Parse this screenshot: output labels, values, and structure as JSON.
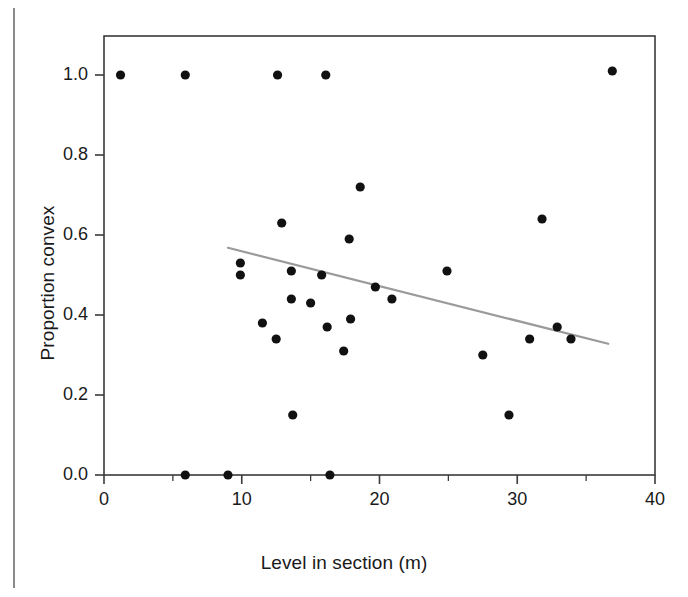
{
  "figure": {
    "background": "#ffffff",
    "frame_color": "#3a3a3a",
    "point_color": "#111111",
    "trend_color": "#9a9a9a"
  },
  "chart_data": {
    "type": "scatter",
    "title": "",
    "xlabel": "Level in section (m)",
    "ylabel": "Proportion convex",
    "xlim": [
      0,
      40
    ],
    "ylim": [
      0.0,
      1.08
    ],
    "grid": false,
    "legend": null,
    "xticks": [
      0,
      10,
      20,
      30,
      40
    ],
    "xtick_labels": [
      "0",
      "10",
      "20",
      "30",
      "40"
    ],
    "xminor_ticks": [
      5,
      15,
      25,
      35
    ],
    "yticks": [
      0.0,
      0.2,
      0.4,
      0.6,
      0.8,
      1.0
    ],
    "ytick_labels": [
      "0.0",
      "0.2",
      "0.4",
      "0.6",
      "0.8",
      "1.0"
    ],
    "series": [
      {
        "name": "Proportion convex by level",
        "marker": "filled-circle",
        "points": [
          {
            "x": 1.2,
            "y": 1.0
          },
          {
            "x": 5.9,
            "y": 1.0
          },
          {
            "x": 12.6,
            "y": 1.0
          },
          {
            "x": 16.1,
            "y": 1.0
          },
          {
            "x": 36.9,
            "y": 1.01
          },
          {
            "x": 18.6,
            "y": 0.72
          },
          {
            "x": 31.8,
            "y": 0.64
          },
          {
            "x": 12.9,
            "y": 0.63
          },
          {
            "x": 17.8,
            "y": 0.59
          },
          {
            "x": 9.9,
            "y": 0.53
          },
          {
            "x": 13.6,
            "y": 0.51
          },
          {
            "x": 24.9,
            "y": 0.51
          },
          {
            "x": 9.9,
            "y": 0.5
          },
          {
            "x": 15.8,
            "y": 0.5
          },
          {
            "x": 19.7,
            "y": 0.47
          },
          {
            "x": 20.9,
            "y": 0.44
          },
          {
            "x": 13.6,
            "y": 0.44
          },
          {
            "x": 15.0,
            "y": 0.43
          },
          {
            "x": 11.5,
            "y": 0.38
          },
          {
            "x": 17.9,
            "y": 0.39
          },
          {
            "x": 16.2,
            "y": 0.37
          },
          {
            "x": 12.5,
            "y": 0.34
          },
          {
            "x": 30.9,
            "y": 0.34
          },
          {
            "x": 32.9,
            "y": 0.37
          },
          {
            "x": 33.9,
            "y": 0.34
          },
          {
            "x": 17.4,
            "y": 0.31
          },
          {
            "x": 27.5,
            "y": 0.3
          },
          {
            "x": 13.7,
            "y": 0.15
          },
          {
            "x": 29.4,
            "y": 0.15
          },
          {
            "x": 5.9,
            "y": 0.0
          },
          {
            "x": 9.0,
            "y": 0.0
          },
          {
            "x": 16.4,
            "y": 0.0
          }
        ]
      }
    ],
    "trendline": {
      "name": "least-squares fit",
      "x_start": 9.0,
      "y_start": 0.568,
      "x_end": 36.6,
      "y_end": 0.328
    }
  }
}
